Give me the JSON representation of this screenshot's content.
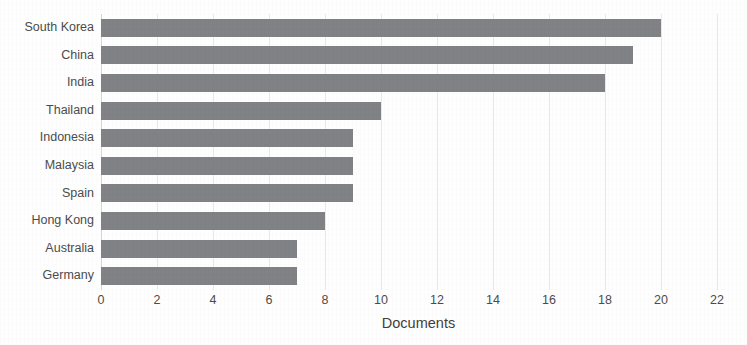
{
  "chart_data": {
    "type": "bar",
    "orientation": "horizontal",
    "title": "",
    "subtitle": "",
    "xlabel": "Documents",
    "ylabel": "",
    "categories": [
      "South Korea",
      "China",
      "India",
      "Thailand",
      "Indonesia",
      "Malaysia",
      "Spain",
      "Hong Kong",
      "Australia",
      "Germany"
    ],
    "values": [
      20,
      19,
      18,
      10,
      9,
      9,
      9,
      8,
      7,
      7
    ],
    "series": [
      {
        "name": "Documents",
        "values": [
          20,
          19,
          18,
          10,
          9,
          9,
          9,
          8,
          7,
          7
        ]
      }
    ],
    "xlim": [
      0,
      22
    ],
    "xticks": [
      0,
      2,
      4,
      6,
      8,
      10,
      12,
      14,
      16,
      18,
      20,
      22
    ],
    "xtick_labels": [
      "0",
      "2",
      "4",
      "6",
      "8",
      "10",
      "12",
      "14",
      "16",
      "18",
      "20",
      "22"
    ],
    "grid": "vertical",
    "legend": "none",
    "annotations": [],
    "bar_color": "#808285",
    "gridline_color": "#e9e9e9",
    "text_color": "#4c4c4c",
    "background_color": "#fefefe"
  }
}
